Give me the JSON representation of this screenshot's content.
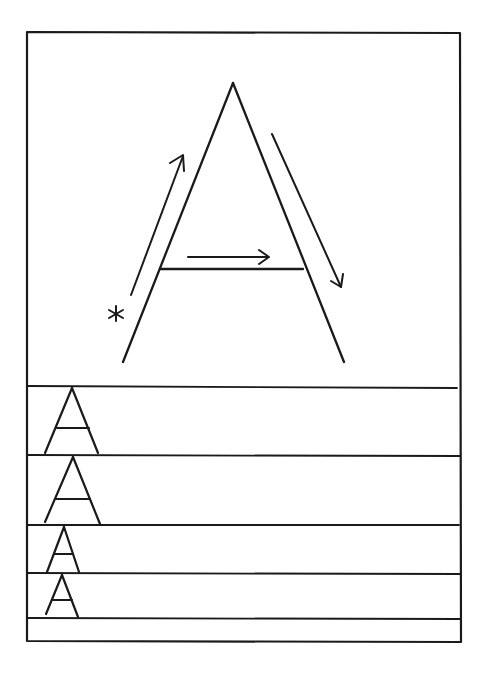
{
  "worksheet": {
    "title": "Letter A handwriting practice",
    "letter": "A",
    "start_marker": "*",
    "colors": {
      "ink": "#1a1a1a",
      "paper": "#ffffff"
    },
    "stroke_guide": {
      "strokes": [
        {
          "order": 1,
          "name": "left-diagonal",
          "direction": "up-right",
          "from": [
            123,
            362
          ],
          "to": [
            233,
            83
          ]
        },
        {
          "order": 2,
          "name": "right-diagonal",
          "direction": "down-right",
          "from": [
            233,
            83
          ],
          "to": [
            343,
            362
          ]
        },
        {
          "order": 3,
          "name": "crossbar",
          "direction": "right",
          "from": [
            160,
            269
          ],
          "to": [
            303,
            269
          ]
        }
      ],
      "arrows": [
        {
          "name": "arrow-up-left-stroke",
          "from": [
            130,
            295
          ],
          "to": [
            183,
            155
          ]
        },
        {
          "name": "arrow-down-right-stroke",
          "from": [
            272,
            133
          ],
          "to": [
            341,
            287
          ]
        },
        {
          "name": "arrow-crossbar",
          "from": [
            188,
            257
          ],
          "to": [
            268,
            257
          ]
        }
      ]
    },
    "practice_rows": [
      {
        "index": 1,
        "top": 387,
        "bottom": 455,
        "sample_letter": "A"
      },
      {
        "index": 2,
        "top": 455,
        "bottom": 525,
        "sample_letter": "A"
      },
      {
        "index": 3,
        "top": 525,
        "bottom": 573,
        "sample_letter": "A"
      },
      {
        "index": 4,
        "top": 573,
        "bottom": 618,
        "sample_letter": "A"
      },
      {
        "index": 5,
        "top": 618,
        "bottom": 642,
        "sample_letter": ""
      }
    ]
  }
}
